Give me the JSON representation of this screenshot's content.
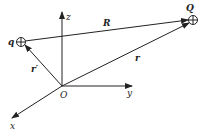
{
  "diagram": {
    "title": "",
    "axes": {
      "x_label": "x",
      "y_label": "y",
      "z_label": "z",
      "origin_label": "O"
    },
    "charges": [
      {
        "name": "source-charge",
        "label": "q",
        "symbol": "⊕"
      },
      {
        "name": "field-charge",
        "label": "Q",
        "symbol": "⊕"
      }
    ],
    "vectors": [
      {
        "name": "R",
        "label": "R",
        "from": "q",
        "to": "Q"
      },
      {
        "name": "r",
        "label": "r",
        "from": "O",
        "to": "Q"
      },
      {
        "name": "r-prime",
        "label": "r′",
        "from": "O",
        "to": "q"
      }
    ],
    "colors": {
      "stroke": "#222222",
      "background": "#ffffff"
    }
  }
}
